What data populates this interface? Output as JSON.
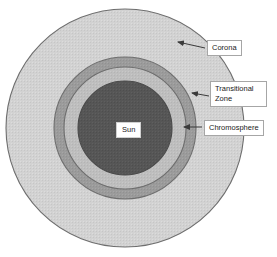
{
  "diagram": {
    "center_label": "Sun",
    "layers": [
      {
        "name": "corona",
        "label": "Corona",
        "color": "#d0d0d0",
        "stroke": "#6e6e6e",
        "radius": 119
      },
      {
        "name": "transitional-zone",
        "label": "Transitional Zone",
        "color": "#9a9a9a",
        "stroke": "#6e6e6e",
        "radius": 71
      },
      {
        "name": "chromosphere",
        "label": "Chromosphere",
        "color": "#bdbdbd",
        "stroke": "#6e6e6e",
        "radius": 61
      },
      {
        "name": "sun-core",
        "label": "Sun",
        "color": "#555555",
        "stroke": "#4a4a4a",
        "radius": 47
      }
    ],
    "labels": [
      {
        "id": "corona",
        "text": "Corona"
      },
      {
        "id": "transitional",
        "text": "Transitional Zone"
      },
      {
        "id": "chromosphere",
        "text": "Chromosphere"
      },
      {
        "id": "sun",
        "text": "Sun"
      }
    ],
    "background": "#ffffff",
    "arrow_color": "#3a3a3a"
  }
}
